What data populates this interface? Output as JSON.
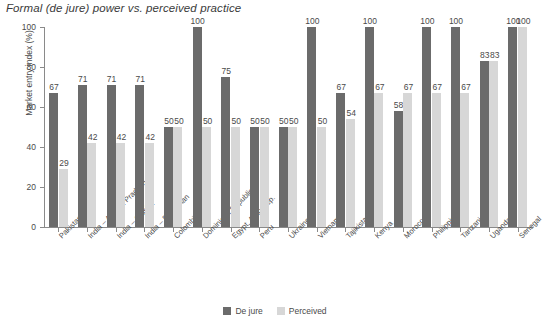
{
  "chart_data": {
    "type": "bar",
    "title": "Formal (de jure) power vs. perceived practice",
    "xlabel": "",
    "ylabel": "Market entry index (%)",
    "ylim": [
      0,
      100
    ],
    "yticks": [
      0,
      20,
      40,
      60,
      80,
      100
    ],
    "grid": false,
    "legend_position": "bottom-center",
    "categories": [
      "Pakistan",
      "India – Andhra Pradesh",
      "India – Odisha",
      "India – Rajasthan",
      "Colombia",
      "Dominican Republic",
      "Egypt, Arab Rep.",
      "Peru",
      "Ukraine",
      "Vietnam",
      "Tajikistan",
      "Kenya",
      "Morocco",
      "Philippines",
      "Tanzania",
      "Uganda",
      "Senegal"
    ],
    "series": [
      {
        "name": "De jure",
        "color": "#6b6b6b",
        "values": [
          67,
          71,
          71,
          71,
          50,
          100,
          75,
          50,
          50,
          100,
          67,
          100,
          58,
          100,
          100,
          83,
          100
        ]
      },
      {
        "name": "Perceived",
        "color": "#d7d7d7",
        "values": [
          29,
          42,
          42,
          42,
          50,
          50,
          50,
          50,
          50,
          50,
          54,
          67,
          67,
          67,
          67,
          83,
          100
        ]
      }
    ]
  },
  "colors": {
    "dejure": "#6b6b6b",
    "perceived": "#d7d7d7",
    "axis": "#8a8a8a",
    "text": "#4a4a4a",
    "background": "#ffffff"
  }
}
